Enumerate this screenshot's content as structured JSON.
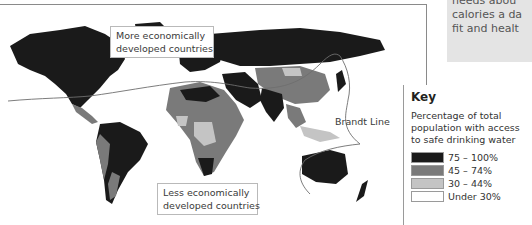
{
  "sidebar_note": {
    "lines": [
      "needs abou",
      "calories a da",
      "fit and healt"
    ]
  },
  "map": {
    "callouts": {
      "medc_line1": "More economically",
      "medc_line2": "developed countries",
      "ledc_line1": "Less economically",
      "ledc_line2": "developed countries"
    },
    "brandt_line_label": "Brandt Line"
  },
  "key": {
    "title": "Key",
    "description": "Percentage of total population with access to safe drinking water",
    "items": [
      {
        "label": "75 – 100%",
        "color": "#1a1a1a"
      },
      {
        "label": "45 – 74%",
        "color": "#7a7a7a"
      },
      {
        "label": "30 – 44%",
        "color": "#c4c4c4"
      },
      {
        "label": "Under 30%",
        "color": "#ffffff"
      }
    ]
  },
  "colors": {
    "high": "#1a1a1a",
    "mid": "#7a7a7a",
    "low": "#c4c4c4",
    "very_low": "#ffffff",
    "brandt_line": "#6e6e6e"
  }
}
